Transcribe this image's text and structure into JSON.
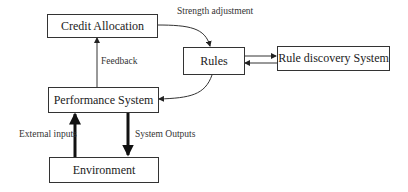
{
  "diagram": {
    "nodes": {
      "credit_allocation": "Credit Allocation",
      "rules": "Rules",
      "rule_discovery": "Rule discovery System",
      "performance_system": "Performance System",
      "environment": "Environment"
    },
    "edges": {
      "strength_adjustment": "Strength adjustment",
      "feedback": "Feedback",
      "external_inputs": "External inputs",
      "system_outputs": "System Outputs"
    }
  }
}
